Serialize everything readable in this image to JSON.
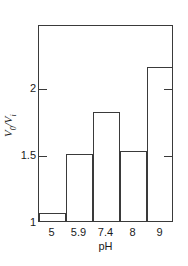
{
  "chart_data": {
    "type": "bar",
    "title": "",
    "subtitle": "",
    "xlabel": "pH",
    "ylabel": "V0/Vi",
    "ylabel_parts": {
      "numerator_base": "V",
      "numerator_sub": "0",
      "separator": "/",
      "denominator_base": "V",
      "denominator_sub": "i"
    },
    "categories": [
      "5",
      "5.9",
      "7.4",
      "8",
      "9"
    ],
    "values": [
      1.06,
      1.5,
      1.81,
      1.52,
      2.15
    ],
    "ylim": [
      1,
      2.47
    ],
    "yticks": [
      1,
      1.5,
      2
    ],
    "ytick_labels": [
      "1",
      "1.5",
      "2"
    ],
    "xtick_labels": [
      "5",
      "5.9",
      "7.4",
      "8",
      "9"
    ],
    "grid": false,
    "legend": null,
    "legend_position": "none",
    "bar_fill": "#ffffff",
    "bar_edge": "#3a3a3a",
    "axis_color": "#3a3a3a",
    "background": "#ffffff",
    "annotations": []
  }
}
